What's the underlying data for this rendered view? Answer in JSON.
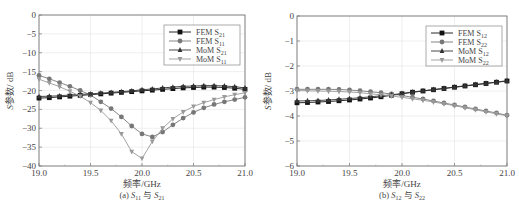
{
  "chart_data": [
    {
      "type": "line",
      "panel": "a",
      "caption": "(a) S11 与 S21",
      "caption_parts": {
        "prefix": "(a) ",
        "s1": "S",
        "s1_sub": "11",
        "mid": " 与 ",
        "s2": "S",
        "s2_sub": "21"
      },
      "xlabel": "频率/GHz",
      "ylabel": "S参数/ dB",
      "xlim": [
        19.0,
        21.0
      ],
      "ylim": [
        -40,
        0
      ],
      "xticks": [
        "19.0",
        "19.5",
        "20.0",
        "20.5",
        "21.0"
      ],
      "yticks": [
        "0",
        "-5",
        "-10",
        "-15",
        "-20",
        "-25",
        "-30",
        "-35",
        "-40"
      ],
      "grid": true,
      "legend_position": "upper right",
      "x": [
        19.0,
        19.1,
        19.2,
        19.3,
        19.4,
        19.5,
        19.6,
        19.7,
        19.8,
        19.9,
        20.0,
        20.1,
        20.2,
        20.3,
        20.4,
        20.5,
        20.6,
        20.7,
        20.8,
        20.9,
        21.0
      ],
      "series": [
        {
          "name": "FEM S21",
          "label_main": "FEM S",
          "label_sub": "21",
          "marker": "square",
          "color": "#111111",
          "values": [
            -22.0,
            -21.9,
            -21.7,
            -21.5,
            -21.3,
            -21.1,
            -20.9,
            -20.7,
            -20.5,
            -20.3,
            -20.1,
            -19.9,
            -19.7,
            -19.5,
            -19.3,
            -19.2,
            -19.1,
            -19.1,
            -19.2,
            -19.4,
            -19.7
          ]
        },
        {
          "name": "FEM S11",
          "label_main": "FEM S",
          "label_sub": "11",
          "marker": "circle",
          "color": "#777777",
          "values": [
            -16.0,
            -16.9,
            -17.9,
            -18.9,
            -20.0,
            -21.2,
            -23.0,
            -24.8,
            -27.0,
            -29.4,
            -31.5,
            -32.3,
            -31.0,
            -29.1,
            -27.3,
            -25.8,
            -24.6,
            -23.7,
            -23.0,
            -22.4,
            -21.8
          ]
        },
        {
          "name": "MoM S21",
          "label_main": "MoM S",
          "label_sub": "21",
          "marker": "triangle-up",
          "color": "#333333",
          "values": [
            -21.6,
            -21.5,
            -21.4,
            -21.2,
            -21.0,
            -20.9,
            -20.7,
            -20.5,
            -20.3,
            -20.1,
            -19.8,
            -19.6,
            -19.3,
            -19.1,
            -18.9,
            -18.8,
            -18.7,
            -18.7,
            -18.8,
            -19.0,
            -19.3
          ]
        },
        {
          "name": "MoM S11",
          "label_main": "MoM S",
          "label_sub": "11",
          "marker": "triangle-down",
          "color": "#999999",
          "values": [
            -17.0,
            -18.0,
            -19.0,
            -20.2,
            -21.5,
            -23.2,
            -25.3,
            -28.0,
            -31.5,
            -36.2,
            -38.0,
            -33.5,
            -30.0,
            -27.5,
            -25.7,
            -24.2,
            -23.2,
            -22.4,
            -21.7,
            -21.1,
            -20.6
          ]
        }
      ]
    },
    {
      "type": "line",
      "panel": "b",
      "caption": "(b) S12 与 S22",
      "caption_parts": {
        "prefix": "(b) ",
        "s1": "S",
        "s1_sub": "12",
        "mid": " 与 ",
        "s2": "S",
        "s2_sub": "22"
      },
      "xlabel": "频率/GHz",
      "ylabel": "S参数/ dB",
      "xlim": [
        19.0,
        21.0
      ],
      "ylim": [
        -6,
        0
      ],
      "xticks": [
        "19.0",
        "19.5",
        "20.0",
        "20.5",
        "21.0"
      ],
      "yticks": [
        "0",
        "-1",
        "-2",
        "-3",
        "-4",
        "-5",
        "-6"
      ],
      "grid": true,
      "legend_position": "upper right",
      "x": [
        19.0,
        19.1,
        19.2,
        19.3,
        19.4,
        19.5,
        19.6,
        19.7,
        19.8,
        19.9,
        20.0,
        20.1,
        20.2,
        20.3,
        20.4,
        20.5,
        20.6,
        20.7,
        20.8,
        20.9,
        21.0
      ],
      "series": [
        {
          "name": "FEM S12",
          "label_main": "FEM S",
          "label_sub": "12",
          "marker": "square",
          "color": "#111111",
          "values": [
            -3.47,
            -3.46,
            -3.44,
            -3.42,
            -3.39,
            -3.36,
            -3.32,
            -3.28,
            -3.23,
            -3.17,
            -3.11,
            -3.05,
            -3.0,
            -2.95,
            -2.9,
            -2.85,
            -2.8,
            -2.75,
            -2.7,
            -2.65,
            -2.6
          ]
        },
        {
          "name": "FEM S22",
          "label_main": "FEM S",
          "label_sub": "22",
          "marker": "circle",
          "color": "#777777",
          "values": [
            -2.93,
            -2.93,
            -2.93,
            -2.93,
            -2.94,
            -2.96,
            -2.99,
            -3.03,
            -3.07,
            -3.12,
            -3.18,
            -3.25,
            -3.32,
            -3.4,
            -3.48,
            -3.56,
            -3.64,
            -3.72,
            -3.8,
            -3.88,
            -3.97
          ]
        },
        {
          "name": "MoM S12",
          "label_main": "MoM S",
          "label_sub": "12",
          "marker": "triangle-up",
          "color": "#333333",
          "values": [
            -3.4,
            -3.39,
            -3.38,
            -3.36,
            -3.33,
            -3.3,
            -3.27,
            -3.23,
            -3.19,
            -3.15,
            -3.1,
            -3.04,
            -2.99,
            -2.94,
            -2.89,
            -2.84,
            -2.79,
            -2.74,
            -2.69,
            -2.64,
            -2.59
          ]
        },
        {
          "name": "MoM S22",
          "label_main": "MoM S",
          "label_sub": "22",
          "marker": "triangle-down",
          "color": "#999999",
          "values": [
            -2.98,
            -2.99,
            -3.0,
            -3.01,
            -3.02,
            -3.04,
            -3.07,
            -3.11,
            -3.15,
            -3.2,
            -3.25,
            -3.31,
            -3.37,
            -3.44,
            -3.51,
            -3.59,
            -3.67,
            -3.75,
            -3.83,
            -3.91,
            -3.99
          ]
        }
      ]
    }
  ]
}
